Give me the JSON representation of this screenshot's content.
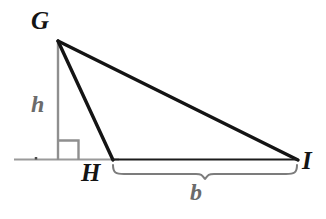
{
  "figure": {
    "type": "geometry-diagram",
    "background_color": "#ffffff",
    "stroke_color_primary": "#141414",
    "stroke_color_secondary": "#8a8a8a",
    "labels": {
      "apex": "G",
      "foot_vertex": "H",
      "right_vertex": "I",
      "height": "h",
      "base": "b"
    },
    "points": {
      "G": {
        "x": 58,
        "y": 41
      },
      "H": {
        "x": 113,
        "y": 160
      },
      "I": {
        "x": 298,
        "y": 160
      },
      "foot_of_altitude": {
        "x": 58,
        "y": 160
      }
    },
    "ground_line": {
      "x1": 14,
      "y1": 160,
      "x2": 118,
      "y2": 160
    },
    "right_angle_marker": {
      "x": 58,
      "y": 140,
      "size": 20
    },
    "brace": {
      "x1": 113,
      "x2": 297,
      "y": 166,
      "depth": 10
    },
    "tick_mark": {
      "x": 36,
      "y": 159
    }
  }
}
